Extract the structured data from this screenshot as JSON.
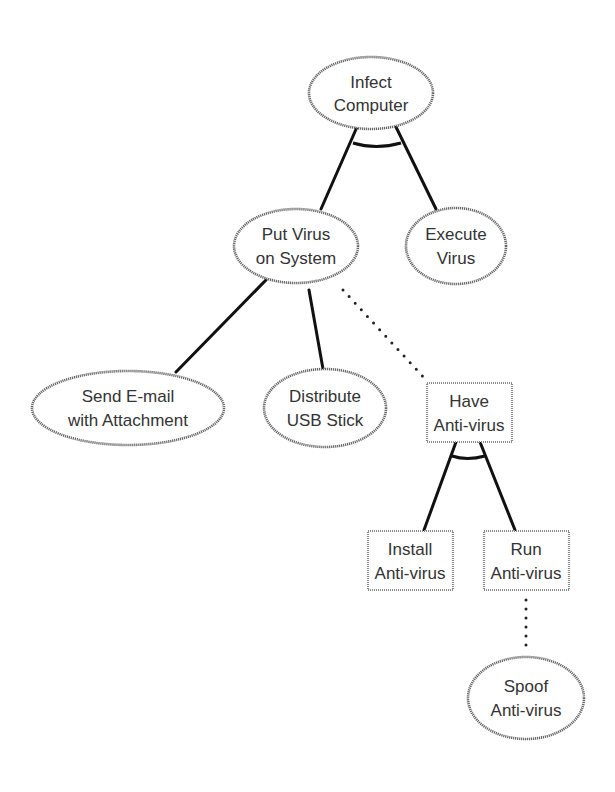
{
  "diagram": {
    "type": "attack-tree",
    "nodes": {
      "infect_computer": {
        "line1": "Infect",
        "line2": "Computer",
        "shape": "ellipse",
        "kind": "attack"
      },
      "put_virus": {
        "line1": "Put Virus",
        "line2": "on System",
        "shape": "ellipse",
        "kind": "attack"
      },
      "execute_virus": {
        "line1": "Execute",
        "line2": "Virus",
        "shape": "ellipse",
        "kind": "attack"
      },
      "send_email": {
        "line1": "Send E-mail",
        "line2": "with Attachment",
        "shape": "ellipse",
        "kind": "attack"
      },
      "distribute_usb": {
        "line1": "Distribute",
        "line2": "USB Stick",
        "shape": "ellipse",
        "kind": "attack"
      },
      "have_antivirus": {
        "line1": "Have",
        "line2": "Anti-virus",
        "shape": "rectangle",
        "kind": "countermeasure"
      },
      "install_antivirus": {
        "line1": "Install",
        "line2": "Anti-virus",
        "shape": "rectangle",
        "kind": "countermeasure"
      },
      "run_antivirus": {
        "line1": "Run",
        "line2": "Anti-virus",
        "shape": "rectangle",
        "kind": "countermeasure"
      },
      "spoof_antivirus": {
        "line1": "Spoof",
        "line2": "Anti-virus",
        "shape": "ellipse",
        "kind": "attack"
      }
    },
    "edges": [
      {
        "from": "Infect Computer",
        "to": "Put Virus on System",
        "style": "solid",
        "and": true
      },
      {
        "from": "Infect Computer",
        "to": "Execute Virus",
        "style": "solid",
        "and": true
      },
      {
        "from": "Put Virus on System",
        "to": "Send E-mail with Attachment",
        "style": "solid"
      },
      {
        "from": "Put Virus on System",
        "to": "Distribute USB Stick",
        "style": "solid"
      },
      {
        "from": "Put Virus on System",
        "to": "Have Anti-virus",
        "style": "dotted"
      },
      {
        "from": "Have Anti-virus",
        "to": "Install Anti-virus",
        "style": "solid",
        "and": true
      },
      {
        "from": "Have Anti-virus",
        "to": "Run Anti-virus",
        "style": "solid",
        "and": true
      },
      {
        "from": "Run Anti-virus",
        "to": "Spoof Anti-virus",
        "style": "dotted"
      }
    ]
  }
}
